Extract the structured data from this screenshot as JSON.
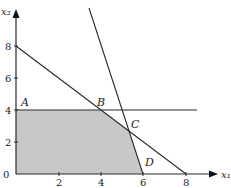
{
  "diagram": {
    "axes": {
      "x_label": "x₁",
      "y_label": "x₂",
      "origin_label": "0",
      "x_ticks": [
        "2",
        "4",
        "6",
        "8"
      ],
      "y_ticks": [
        "2",
        "4",
        "6",
        "8"
      ]
    },
    "constraints": [
      {
        "name": "x1 + x2 = 8",
        "from": [
          0,
          8
        ],
        "to": [
          8,
          0
        ]
      },
      {
        "name": "x2 = 4",
        "from": [
          0,
          4
        ],
        "to": [
          8.5,
          4
        ]
      },
      {
        "name": "4x1 + x2 = 24",
        "from": [
          3.45,
          10.4
        ],
        "to": [
          6,
          0
        ]
      }
    ],
    "feasible_region": {
      "vertices": [
        [
          0,
          0
        ],
        [
          0,
          4
        ],
        [
          4,
          4
        ],
        [
          5.33,
          2.67
        ],
        [
          6,
          0
        ]
      ],
      "fill": "#c8c8c8"
    },
    "points": [
      {
        "label": "A",
        "at": [
          0.3,
          4.4
        ]
      },
      {
        "label": "B",
        "at": [
          3.8,
          4.4
        ]
      },
      {
        "label": "C",
        "at": [
          5.45,
          2.9
        ]
      },
      {
        "label": "D",
        "at": [
          6.0,
          0.6
        ]
      }
    ],
    "colors": {
      "line": "#2a2a2a",
      "region": "#c8c8c8",
      "background": "#ffffff"
    }
  }
}
